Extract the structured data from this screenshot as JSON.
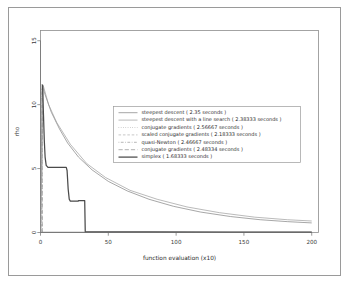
{
  "chart_data": {
    "type": "line",
    "title": "",
    "xlabel": "function evaluation (x10)",
    "ylabel": "rho",
    "xlim": [
      0,
      205
    ],
    "ylim": [
      0,
      15.8
    ],
    "grid": false,
    "legend_position": "center",
    "xticks": [
      "0",
      "50",
      "100",
      "150",
      "200"
    ],
    "xtick_values": [
      0,
      50,
      100,
      150,
      200
    ],
    "yticks": [
      "0",
      "5",
      "10",
      "15"
    ],
    "ytick_values": [
      0,
      5,
      10,
      15
    ],
    "series": [
      {
        "name": "steepest descent",
        "label": "steepest descent ( 2.35 seconds )",
        "seconds": 2.35,
        "style": "solid",
        "color": "#8a8a8a",
        "width": 0.75,
        "points": [
          [
            0,
            0
          ],
          [
            1.2,
            11.6
          ],
          [
            3,
            10.9
          ],
          [
            8,
            9.4
          ],
          [
            14,
            8.1
          ],
          [
            20,
            7.0
          ],
          [
            28,
            5.9
          ],
          [
            38,
            4.9
          ],
          [
            50,
            4.0
          ],
          [
            64,
            3.25
          ],
          [
            80,
            2.6
          ],
          [
            98,
            2.05
          ],
          [
            118,
            1.6
          ],
          [
            140,
            1.25
          ],
          [
            162,
            1.0
          ],
          [
            182,
            0.85
          ],
          [
            200,
            0.75
          ]
        ]
      },
      {
        "name": "steepest descent with a line search",
        "label": "steepest descent with a line search ( 2.38333 seconds )",
        "seconds": 2.38333,
        "style": "solid",
        "color": "#9c9c9c",
        "width": 0.7,
        "points": [
          [
            0,
            0
          ],
          [
            2,
            11.5
          ],
          [
            6,
            10.0
          ],
          [
            12,
            8.6
          ],
          [
            22,
            6.9
          ],
          [
            34,
            5.4
          ],
          [
            48,
            4.3
          ],
          [
            66,
            3.3
          ],
          [
            86,
            2.6
          ],
          [
            108,
            2.0
          ],
          [
            132,
            1.55
          ],
          [
            158,
            1.2
          ],
          [
            182,
            1.0
          ],
          [
            200,
            0.9
          ]
        ]
      },
      {
        "name": "conjugate gradients",
        "label": "conjugate gradients ( 2.56667 seconds )",
        "seconds": 2.56667,
        "style": "dotted",
        "color": "#a5a5a5",
        "width": 0.7,
        "points": [
          [
            0.6,
            11.4
          ],
          [
            0.6,
            0.08
          ]
        ]
      },
      {
        "name": "scaled conjugate gradients",
        "label": "scaled conjugate gradients ( 2.18333 seconds )",
        "seconds": 2.18333,
        "style": "dashed",
        "color": "#b0b0b0",
        "width": 0.7,
        "points": [
          [
            0.9,
            11.3
          ],
          [
            0.9,
            0.06
          ]
        ]
      },
      {
        "name": "quasi-Newton",
        "label": "quasi-Newton ( 2.46667 seconds )",
        "seconds": 2.46667,
        "style": "dotdash",
        "color": "#9a9a9a",
        "width": 0.7,
        "points": [
          [
            1.1,
            11.2
          ],
          [
            1.1,
            0.05
          ]
        ]
      },
      {
        "name": "conjugate gradients 2",
        "label": "conjugate gradients ( 2.48334 seconds )",
        "seconds": 2.48334,
        "style": "longdash",
        "color": "#8f8f8f",
        "width": 0.7,
        "points": [
          [
            1.3,
            11.0
          ],
          [
            1.3,
            0.04
          ]
        ]
      },
      {
        "name": "simplex",
        "label": "simplex ( 1.68333 seconds )",
        "seconds": 1.68333,
        "style": "solid-bold",
        "color": "#4a4a4a",
        "width": 1.25,
        "points": [
          [
            1.5,
            11.55
          ],
          [
            2.2,
            9.2
          ],
          [
            2.8,
            7.2
          ],
          [
            3.4,
            5.9
          ],
          [
            4.2,
            5.25
          ],
          [
            5.5,
            5.1
          ],
          [
            19,
            5.1
          ],
          [
            19.6,
            4.85
          ],
          [
            20.4,
            3.4
          ],
          [
            21.2,
            2.6
          ],
          [
            22,
            2.45
          ],
          [
            27,
            2.45
          ],
          [
            27.4,
            2.45
          ],
          [
            27.8,
            2.45
          ],
          [
            28,
            2.5
          ],
          [
            28,
            2.5
          ],
          [
            30,
            2.5
          ],
          [
            32.6,
            2.5
          ],
          [
            33,
            0.05
          ],
          [
            40,
            0.05
          ],
          [
            80,
            0.04
          ],
          [
            140,
            0.03
          ],
          [
            200,
            0.03
          ]
        ]
      }
    ],
    "baseline": {
      "name": "axis-baseline",
      "points": [
        [
          0,
          0.02
        ],
        [
          200,
          0.02
        ]
      ]
    }
  },
  "legend": {
    "entries": [
      "steepest descent ( 2.35 seconds )",
      "steepest descent with a line search ( 2.38333 seconds )",
      "conjugate gradients ( 2.56667 seconds )",
      "scaled conjugate gradients ( 2.18333 seconds )",
      "quasi-Newton ( 2.46667 seconds )",
      "conjugate gradients ( 2.48334 seconds )",
      "simplex ( 1.68333 seconds )"
    ]
  }
}
